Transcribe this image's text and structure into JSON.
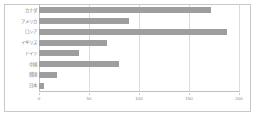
{
  "chart_data": {
    "type": "bar",
    "orientation": "horizontal",
    "title": "",
    "subtitle": "",
    "xlabel": "",
    "ylabel": "",
    "categories": [
      "カナダ",
      "アメリカ",
      "ロシア",
      "イギリス",
      "ドイツ",
      "中国",
      "韓国",
      "日本"
    ],
    "values": [
      172,
      90,
      188,
      68,
      40,
      80,
      18,
      5
    ],
    "series": [
      {
        "name": "",
        "values": [
          172,
          90,
          188,
          68,
          40,
          80,
          18,
          5
        ]
      }
    ],
    "xlim": [
      0,
      200
    ],
    "xticks": [
      0,
      50,
      100,
      150,
      200
    ],
    "xtick_labels": [
      "0",
      "50",
      "100",
      "150",
      "200"
    ],
    "grid": true,
    "grid_axis": "x",
    "legend": false,
    "legend_position": "none",
    "bar_color": "#9e9e9e",
    "grid_color": "#dcdcdc",
    "axis_color": "#c0c0c0",
    "border_color": "#c8c8c8",
    "background_color": "#ffffff",
    "label_color": "#7a7a7a"
  }
}
